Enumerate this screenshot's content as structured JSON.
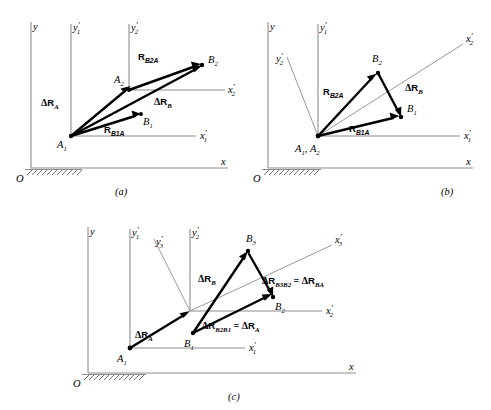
{
  "diagram": {
    "colors": {
      "background": "#ffffff",
      "axis": "#8d8d8d",
      "vector": "#000000",
      "hatch": "#555555",
      "text": "#000000"
    },
    "figures": [
      {
        "id": "a",
        "caption": "(a)",
        "axes": [
          {
            "name": "y-axis-label",
            "label": "y",
            "sub": "",
            "prime": false
          },
          {
            "name": "x-axis-label",
            "label": "x",
            "sub": "",
            "prime": false
          },
          {
            "name": "y1-prime-axis-label",
            "label": "y",
            "sub": "1",
            "prime": true
          },
          {
            "name": "y2-prime-axis-label",
            "label": "y",
            "sub": "2",
            "prime": true
          },
          {
            "name": "x1-prime-axis-label",
            "label": "x",
            "sub": "1",
            "prime": true
          },
          {
            "name": "x2-prime-axis-label",
            "label": "x",
            "sub": "2",
            "prime": true
          }
        ],
        "origin_label": "O",
        "points": [
          {
            "name": "point-a1",
            "label": "A",
            "sub": "1"
          },
          {
            "name": "point-a2",
            "label": "A",
            "sub": "2"
          },
          {
            "name": "point-b1",
            "label": "B",
            "sub": "1"
          },
          {
            "name": "point-b2",
            "label": "B",
            "sub": "2"
          }
        ],
        "vectors": [
          {
            "name": "vector-delta-ra",
            "symbol": "ΔR",
            "sub": "A",
            "kind": "delta"
          },
          {
            "name": "vector-delta-rb",
            "symbol": "ΔR",
            "sub": "B",
            "kind": "delta"
          },
          {
            "name": "vector-rb1a",
            "symbol": "R",
            "sub": "B1A",
            "kind": "position"
          },
          {
            "name": "vector-rb2a",
            "symbol": "R",
            "sub": "B2A",
            "kind": "position"
          }
        ]
      },
      {
        "id": "b",
        "caption": "(b)",
        "axes": [
          {
            "name": "y-axis-label",
            "label": "y",
            "sub": "",
            "prime": false
          },
          {
            "name": "x-axis-label",
            "label": "x",
            "sub": "",
            "prime": false
          },
          {
            "name": "y1-prime-axis-label",
            "label": "y",
            "sub": "1",
            "prime": true
          },
          {
            "name": "y2-prime-axis-label",
            "label": "y",
            "sub": "2",
            "prime": true
          },
          {
            "name": "x1-prime-axis-label",
            "label": "x",
            "sub": "1",
            "prime": true
          },
          {
            "name": "x2-prime-axis-label",
            "label": "x",
            "sub": "2",
            "prime": true
          }
        ],
        "origin_label": "O",
        "points": [
          {
            "name": "point-a1-a2",
            "label": "A",
            "sub": "1",
            "label2": "A",
            "sub2": "2",
            "separator": ", "
          },
          {
            "name": "point-b1",
            "label": "B",
            "sub": "1"
          },
          {
            "name": "point-b2",
            "label": "B",
            "sub": "2"
          }
        ],
        "vectors": [
          {
            "name": "vector-rb2a",
            "symbol": "R",
            "sub": "B2A",
            "kind": "position"
          },
          {
            "name": "vector-rb1a",
            "symbol": "R",
            "sub": "B1A",
            "kind": "position"
          },
          {
            "name": "vector-delta-rb",
            "symbol": "ΔR",
            "sub": "B",
            "kind": "delta"
          }
        ]
      },
      {
        "id": "c",
        "caption": "(c)",
        "axes": [
          {
            "name": "y-axis-label",
            "label": "y",
            "sub": "",
            "prime": false
          },
          {
            "name": "x-axis-label",
            "label": "x",
            "sub": "",
            "prime": false
          },
          {
            "name": "y1-prime-axis-label",
            "label": "y",
            "sub": "1",
            "prime": true
          },
          {
            "name": "y2-prime-axis-label",
            "label": "y",
            "sub": "2",
            "prime": true
          },
          {
            "name": "y3-prime-axis-label",
            "label": "y",
            "sub": "3",
            "prime": true
          },
          {
            "name": "x1-prime-axis-label",
            "label": "x",
            "sub": "1",
            "prime": true
          },
          {
            "name": "x2-prime-axis-label",
            "label": "x",
            "sub": "2",
            "prime": true
          },
          {
            "name": "x3-prime-axis-label",
            "label": "x",
            "sub": "3",
            "prime": true
          }
        ],
        "origin_label": "O",
        "points": [
          {
            "name": "point-a1",
            "label": "A",
            "sub": "1"
          },
          {
            "name": "point-b1",
            "label": "B",
            "sub": "1"
          },
          {
            "name": "point-b2",
            "label": "B",
            "sub": "2"
          },
          {
            "name": "point-b3",
            "label": "B",
            "sub": "3"
          }
        ],
        "vectors": [
          {
            "name": "vector-delta-ra",
            "symbol": "ΔR",
            "sub": "A",
            "kind": "delta"
          },
          {
            "name": "vector-delta-rb",
            "symbol": "ΔR",
            "sub": "B",
            "kind": "delta"
          },
          {
            "name": "vector-delta-rb2b1-eq-delta-ra",
            "symbol": "ΔR",
            "sub": "B2B1",
            "equals": "ΔR",
            "equals_sub": "A",
            "kind": "equation"
          },
          {
            "name": "vector-delta-rb3b2-eq-delta-rba",
            "symbol": "ΔR",
            "sub": "B3B2",
            "equals": "ΔR",
            "equals_sub": "BA",
            "kind": "equation"
          }
        ]
      }
    ]
  }
}
